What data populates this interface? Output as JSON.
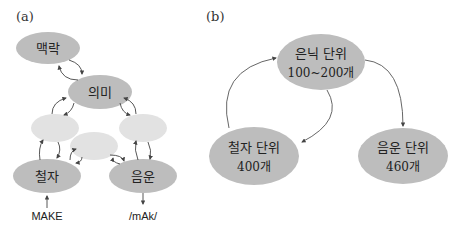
{
  "panel_a": {
    "label": "(a)",
    "nodes": {
      "context": "맥락",
      "meaning": "의미",
      "orthography": "철자",
      "phonology": "음운"
    },
    "input_label": "MAKE",
    "output_label": "/mAk/"
  },
  "panel_b": {
    "label": "(b)",
    "nodes": {
      "hidden": {
        "title": "은닉 단위",
        "count": "100~200개"
      },
      "orthography": {
        "title": "철자 단위",
        "count": "400개"
      },
      "phonology": {
        "title": "음운 단위",
        "count": "460개"
      }
    }
  },
  "colors": {
    "node_dark": "#bdbdbd",
    "node_light": "#e2e2e2",
    "arrow": "#444444"
  }
}
